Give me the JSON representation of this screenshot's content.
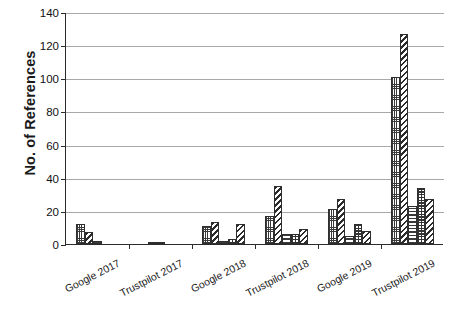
{
  "chart_data": {
    "type": "bar",
    "title": "",
    "subtitle": "",
    "xlabel": "",
    "ylabel": "No. of References",
    "ylim": [
      0,
      140
    ],
    "yticks": [
      0,
      20,
      40,
      60,
      80,
      100,
      120,
      140
    ],
    "ytick_labels": [
      "0",
      "20",
      "40",
      "60",
      "80",
      "100",
      "120",
      "140"
    ],
    "grid": "horizontal",
    "legend": "none",
    "categories": [
      "Google 2017",
      "Trustpilot 2017",
      "Google 2018",
      "Trustpilot 2018",
      "Google 2019",
      "Trustpilot 2019"
    ],
    "series": [
      {
        "name": "Series 1",
        "pattern": "fine-grid",
        "values": [
          12,
          0,
          11,
          17,
          21,
          101
        ]
      },
      {
        "name": "Series 2",
        "pattern": "diagonal-hatch",
        "values": [
          7,
          1,
          13,
          35,
          27,
          127
        ]
      },
      {
        "name": "Series 3",
        "pattern": "horizontal-lines",
        "values": [
          2,
          1,
          2,
          6,
          5,
          23
        ]
      },
      {
        "name": "Series 4",
        "pattern": "checkerboard",
        "values": [
          0,
          0,
          3,
          6,
          12,
          34
        ]
      },
      {
        "name": "Series 5",
        "pattern": "diagonal-hatch-2",
        "values": [
          0,
          0,
          12,
          9,
          8,
          27
        ]
      }
    ],
    "colors": {
      "bar_outline": "#2e2e2e",
      "bar_fill": "#ffffff",
      "gridline": "#a8a8a8",
      "axis": "#2b2b2b",
      "text": "#1a1a1a",
      "background": "#ffffff"
    }
  }
}
